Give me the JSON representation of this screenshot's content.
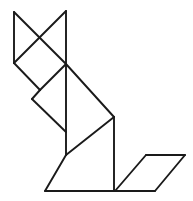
{
  "figure": {
    "canvas": {
      "width": 193,
      "height": 201,
      "background": "#ffffff"
    },
    "stroke": {
      "color": "#1a1a1a",
      "width": 1.9
    },
    "vertices": {
      "ear_left_tip": [
        14,
        12
      ],
      "ear_right_tip": [
        66,
        11
      ],
      "head_left": [
        14,
        63
      ],
      "hub": [
        66,
        64
      ],
      "notch_left": [
        32,
        99
      ],
      "shoulder": [
        114,
        117
      ],
      "spine_bottom": [
        66,
        155
      ],
      "foot_left": [
        45,
        191
      ],
      "body_bottom_right": [
        114,
        191
      ],
      "tail_top_left": [
        146,
        155
      ],
      "tail_top_right": [
        185,
        155
      ],
      "tail_bottom_left": [
        115,
        191
      ],
      "tail_bottom_right": [
        155,
        191
      ]
    },
    "pieces": [
      {
        "name": "ear-left-triangle",
        "label": "Left ear triangle",
        "points": "14,12 14,63 66,64"
      },
      {
        "name": "ear-right-triangle",
        "label": "Right ear triangle",
        "points": "66,11 66,64 14,12"
      },
      {
        "name": "head-diamond",
        "label": "Head square",
        "points": "14,63 40,37 66,64 40,90"
      },
      {
        "name": "neck-triangle",
        "label": "Neck triangle",
        "points": "40,90 66,64 32,99"
      },
      {
        "name": "back-triangle",
        "label": "Back triangle",
        "points": "66,64 114,117 66,117"
      },
      {
        "name": "body-triangle",
        "label": "Body large triangle",
        "points": "66,64 114,117 66,155"
      },
      {
        "name": "haunch-triangle",
        "label": "Haunch triangle",
        "points": "66,155 114,191 114,117"
      },
      {
        "name": "foot-triangle",
        "label": "Front foot triangle",
        "points": "45,191 66,155 114,191"
      },
      {
        "name": "tail-parallelogram",
        "label": "Tail parallelogram",
        "points": "146,155 185,155 155,191 115,191"
      }
    ],
    "edges": [
      {
        "name": "ear-left-outer",
        "from": [
          14,
          12
        ],
        "to": [
          14,
          63
        ]
      },
      {
        "name": "ear-cross-left",
        "from": [
          14,
          12
        ],
        "to": [
          66,
          64
        ]
      },
      {
        "name": "ear-right-vertical",
        "from": [
          66,
          11
        ],
        "to": [
          66,
          64
        ]
      },
      {
        "name": "ear-cross-right",
        "from": [
          66,
          11
        ],
        "to": [
          14,
          63
        ]
      },
      {
        "name": "head-lower-left",
        "from": [
          14,
          63
        ],
        "to": [
          40,
          90
        ]
      },
      {
        "name": "head-lower-right",
        "from": [
          40,
          90
        ],
        "to": [
          66,
          64
        ]
      },
      {
        "name": "neck-upper",
        "from": [
          40,
          90
        ],
        "to": [
          32,
          99
        ]
      },
      {
        "name": "neck-lower",
        "from": [
          32,
          99
        ],
        "to": [
          66,
          132
        ]
      },
      {
        "name": "back-diagonal",
        "from": [
          66,
          64
        ],
        "to": [
          114,
          117
        ]
      },
      {
        "name": "spine-vertical",
        "from": [
          66,
          64
        ],
        "to": [
          66,
          155
        ]
      },
      {
        "name": "haunch-vertical",
        "from": [
          114,
          117
        ],
        "to": [
          114,
          191
        ]
      },
      {
        "name": "foot-diagonal",
        "from": [
          66,
          155
        ],
        "to": [
          45,
          191
        ]
      },
      {
        "name": "body-bottom",
        "from": [
          45,
          191
        ],
        "to": [
          114,
          191
        ]
      },
      {
        "name": "belly-diagonal",
        "from": [
          114,
          117
        ],
        "to": [
          66,
          155
        ]
      },
      {
        "name": "tail-bottom",
        "from": [
          115,
          191
        ],
        "to": [
          155,
          191
        ]
      },
      {
        "name": "tail-top",
        "from": [
          146,
          155
        ],
        "to": [
          185,
          155
        ]
      },
      {
        "name": "tail-left-slant",
        "from": [
          115,
          191
        ],
        "to": [
          146,
          155
        ]
      },
      {
        "name": "tail-right-slant",
        "from": [
          155,
          191
        ],
        "to": [
          185,
          155
        ]
      }
    ]
  }
}
